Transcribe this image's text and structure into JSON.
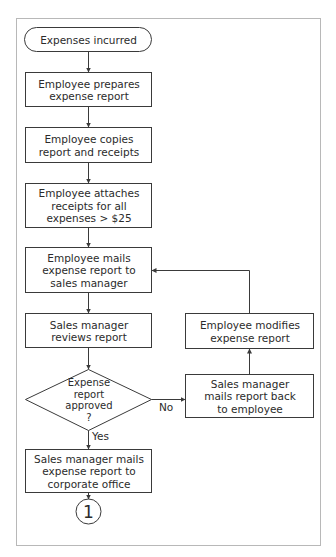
{
  "diagram": {
    "type": "flowchart",
    "nodes": {
      "start": {
        "shape": "terminator",
        "label": "Expenses incurred"
      },
      "prepare": {
        "shape": "process",
        "label": "Employee prepares\nexpense report"
      },
      "copy": {
        "shape": "process",
        "label": "Employee copies\nreport and receipts"
      },
      "attach": {
        "shape": "process",
        "label": "Employee attaches\nreceipts for all\nexpenses > $25"
      },
      "mail_to_manager": {
        "shape": "process",
        "label": "Employee mails\nexpense report to\nsales manager"
      },
      "review": {
        "shape": "process",
        "label": "Sales manager\nreviews report"
      },
      "approved": {
        "shape": "decision",
        "label": "Expense\nreport\napproved\n?"
      },
      "mail_back": {
        "shape": "process",
        "label": "Sales manager\nmails report back\nto employee"
      },
      "modify": {
        "shape": "process",
        "label": "Employee modifies\nexpense report"
      },
      "mail_to_corporate": {
        "shape": "process",
        "label": "Sales manager mails\nexpense report to\ncorporate office"
      },
      "connector": {
        "shape": "off-page-connector",
        "label": "1"
      }
    },
    "edges": [
      {
        "from": "start",
        "to": "prepare",
        "label": ""
      },
      {
        "from": "prepare",
        "to": "copy",
        "label": ""
      },
      {
        "from": "copy",
        "to": "attach",
        "label": ""
      },
      {
        "from": "attach",
        "to": "mail_to_manager",
        "label": ""
      },
      {
        "from": "mail_to_manager",
        "to": "review",
        "label": ""
      },
      {
        "from": "review",
        "to": "approved",
        "label": ""
      },
      {
        "from": "approved",
        "to": "mail_back",
        "label": "No"
      },
      {
        "from": "mail_back",
        "to": "modify",
        "label": ""
      },
      {
        "from": "modify",
        "to": "mail_to_manager",
        "label": ""
      },
      {
        "from": "approved",
        "to": "mail_to_corporate",
        "label": "Yes"
      },
      {
        "from": "mail_to_corporate",
        "to": "connector",
        "label": ""
      }
    ],
    "edge_labels": {
      "no": "No",
      "yes": "Yes"
    },
    "colors": {
      "stroke": "#3a3a3a",
      "frame": "#b8b8b8",
      "background": "#ffffff",
      "text": "#2b2b2b"
    }
  }
}
